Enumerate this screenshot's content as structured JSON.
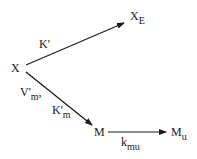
{
  "nodes": {
    "x": {
      "label": "X"
    },
    "xe": {
      "label": "X",
      "sub": "E"
    },
    "m": {
      "label": "M"
    },
    "mu": {
      "label": "M",
      "sub": "u"
    }
  },
  "edges": {
    "x_to_xe": {
      "label": "K'"
    },
    "x_to_m": {
      "label1": "V'",
      "label1_sub": "m",
      "label1_suffix": ",",
      "label2": "K'",
      "label2_sub": "m"
    },
    "m_to_mu": {
      "label": "k",
      "sub": "mu"
    }
  },
  "colors": {
    "stroke": "#1a1a1a",
    "background": "#ffffff"
  }
}
